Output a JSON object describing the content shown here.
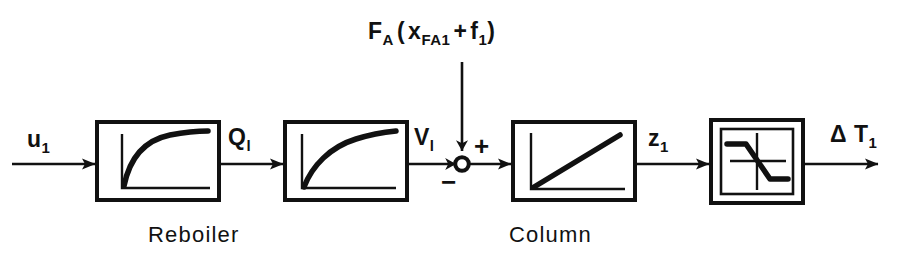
{
  "figure": {
    "type": "block-diagram",
    "title_label": "F_A ( x_FA1 + f_1 )",
    "background_color": "#ffffff",
    "line_color": "#111111"
  },
  "top_input": {
    "base": "F",
    "base_sub": "A",
    "open_paren": "(",
    "var": "x",
    "var_sub": "FA1",
    "plus": "+",
    "term": "f",
    "term_sub": "1",
    "close_paren": ")"
  },
  "signals": [
    {
      "name": "input-signal",
      "base": "u",
      "sub": "1"
    },
    {
      "name": "heat-signal",
      "base": "Q",
      "sub": "l"
    },
    {
      "name": "vapor-signal",
      "base": "V",
      "sub": "l"
    },
    {
      "name": "z-signal",
      "base": "z",
      "sub": "1"
    },
    {
      "name": "output-signal",
      "base": "Δ T",
      "sub": "1"
    }
  ],
  "blocks": [
    {
      "id": "block-1",
      "icon": "saturating-exponential-curve",
      "group": "Reboiler",
      "double_border": false
    },
    {
      "id": "block-2",
      "icon": "saturating-exponential-curve",
      "group": "Reboiler",
      "double_border": false
    },
    {
      "id": "block-3",
      "icon": "linear-ramp-curve",
      "group": "Column",
      "double_border": false
    },
    {
      "id": "block-4",
      "icon": "negative-saturation-s-curve",
      "group": "",
      "double_border": true
    }
  ],
  "captions": [
    {
      "name": "reboiler-caption",
      "text": "Reboiler"
    },
    {
      "name": "column-caption",
      "text": "Column"
    }
  ],
  "summing_junction": {
    "name": "summing-junction",
    "plus_sign": "+",
    "minus_sign": "−",
    "shape": "circle"
  }
}
